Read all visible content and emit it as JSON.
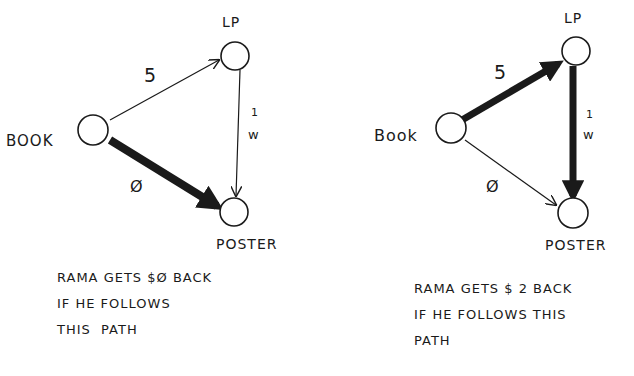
{
  "diagrams": [
    {
      "id": "left",
      "nodes": {
        "book": {
          "label": "BOOK",
          "cx": 97,
          "cy": 130
        },
        "lp": {
          "label": "LP",
          "cx": 233,
          "cy": 57
        },
        "poster": {
          "label": "POSTER",
          "cx": 233,
          "cy": 211
        }
      },
      "edges": [
        {
          "from": "book",
          "to": "lp",
          "weight": "5",
          "highlighted": false
        },
        {
          "from": "lp",
          "to": "poster",
          "weight": "1",
          "highlighted": false
        },
        {
          "from": "book",
          "to": "poster",
          "weight": "Ø",
          "highlighted": true
        }
      ],
      "caption": [
        "RAMA GETS $Ø BACK",
        "IF HE FOLLOWS",
        "THIS  PATH"
      ]
    },
    {
      "id": "right",
      "nodes": {
        "book": {
          "label": "Book",
          "cx": 452,
          "cy": 130
        },
        "lp": {
          "label": "LP",
          "cx": 577,
          "cy": 53
        },
        "poster": {
          "label": "POSTER",
          "cx": 572,
          "cy": 213
        }
      },
      "edges": [
        {
          "from": "book",
          "to": "lp",
          "weight": "5",
          "highlighted": true
        },
        {
          "from": "lp",
          "to": "poster",
          "weight": "1",
          "highlighted": true
        },
        {
          "from": "book",
          "to": "poster",
          "weight": "Ø",
          "highlighted": false
        }
      ],
      "caption": [
        "RAMA GETS $ 2 BACK",
        "IF HE FOLLOWS THIS",
        "PATH"
      ]
    }
  ],
  "glyphs": {
    "weight_mark": "w"
  }
}
